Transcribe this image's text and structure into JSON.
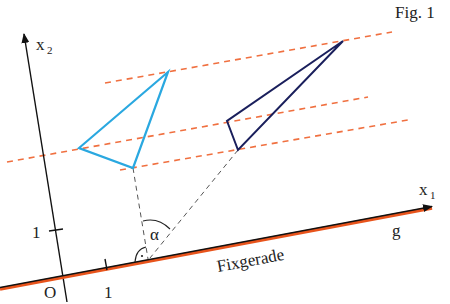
{
  "figure": {
    "caption": "Fig. 1",
    "axes": {
      "x1_label": "x",
      "x1_sub": "1",
      "x2_label": "x",
      "x2_sub": "2",
      "origin_label": "O",
      "x1_tick_label": "1",
      "x2_tick_label": "1"
    },
    "line_g": {
      "name": "g",
      "caption": "Fixgerade"
    },
    "angle_label": "α",
    "colors": {
      "axis": "#111111",
      "fixed_line_outer": "#e8541c",
      "fixed_line_inner": "#111111",
      "projection_lines": "#f07040",
      "original_triangle": "#2aa8e0",
      "image_triangle": "#1a1f5c",
      "construction_lines": "#555555"
    },
    "original_triangle": {
      "points": [
        [
          168,
          72
        ],
        [
          79,
          148
        ],
        [
          133,
          168
        ]
      ]
    },
    "image_triangle": {
      "points": [
        [
          343,
          41
        ],
        [
          227,
          121
        ],
        [
          238,
          150
        ]
      ]
    }
  }
}
